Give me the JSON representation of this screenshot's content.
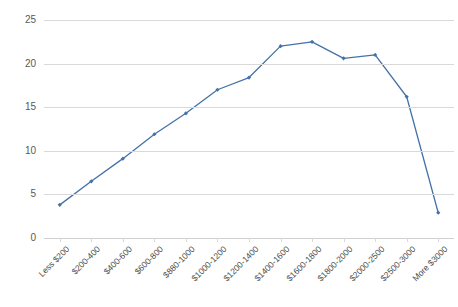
{
  "chart_data": {
    "type": "line",
    "title": "",
    "xlabel": "",
    "ylabel": "",
    "categories": [
      "Less $200",
      "$200-400",
      "$400-600",
      "$600-800",
      "$880-1000",
      "$1000-1200",
      "$1200-1400",
      "$1400-1600",
      "$1600-1800",
      "$1800-2000",
      "$2000-2500",
      "$2500-3000",
      "More $3000"
    ],
    "values": [
      3.8,
      6.5,
      9.1,
      11.9,
      14.3,
      17.0,
      18.4,
      22.0,
      22.5,
      20.6,
      21.0,
      16.2,
      2.9
    ],
    "ylim": [
      0,
      25
    ],
    "y_ticks": [
      "0",
      "5",
      "10",
      "15",
      "20",
      "25"
    ],
    "y_tick_values": [
      0,
      5,
      10,
      15,
      20,
      25
    ],
    "grid": true,
    "legend": "none",
    "series_color": "#4472a8",
    "grid_color": "#d9d9d9",
    "marker": "diamond",
    "background": "#ffffff"
  }
}
